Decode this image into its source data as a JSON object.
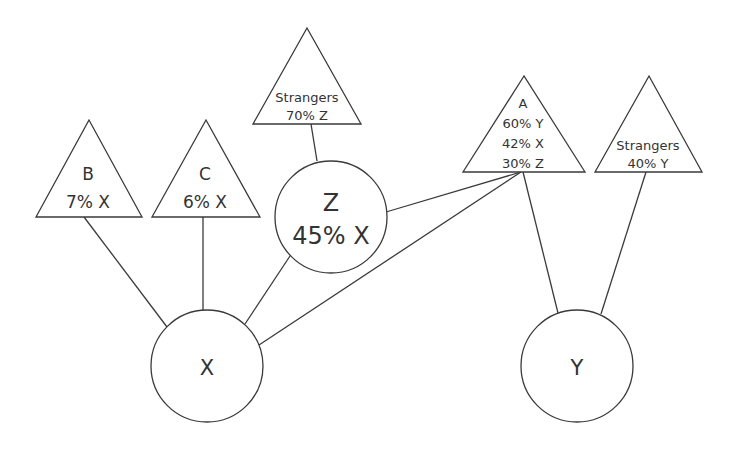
{
  "diagram": {
    "type": "network",
    "nodes": [
      {
        "id": "X",
        "shape": "circle",
        "lines": [
          "X"
        ]
      },
      {
        "id": "Y",
        "shape": "circle",
        "lines": [
          "Y"
        ]
      },
      {
        "id": "Z",
        "shape": "circle",
        "lines": [
          "Z",
          "45% X"
        ]
      },
      {
        "id": "B",
        "shape": "triangle",
        "lines": [
          "B",
          "7% X"
        ]
      },
      {
        "id": "C",
        "shape": "triangle",
        "lines": [
          "C",
          "6% X"
        ]
      },
      {
        "id": "StrangersZ",
        "shape": "triangle",
        "lines": [
          "Strangers",
          "70% Z"
        ]
      },
      {
        "id": "A",
        "shape": "triangle",
        "lines": [
          "A",
          "60% Y",
          "42% X",
          "30% Z"
        ]
      },
      {
        "id": "StrangersY",
        "shape": "triangle",
        "lines": [
          "Strangers",
          "40% Y"
        ]
      }
    ],
    "edges": [
      [
        "B",
        "X"
      ],
      [
        "C",
        "X"
      ],
      [
        "Z",
        "X"
      ],
      [
        "A",
        "X"
      ],
      [
        "StrangersZ",
        "Z"
      ],
      [
        "Z",
        "A"
      ],
      [
        "A",
        "Y"
      ],
      [
        "StrangersY",
        "Y"
      ]
    ]
  },
  "labels": {
    "x": {
      "title": "X"
    },
    "y": {
      "title": "Y"
    },
    "z": {
      "title": "Z",
      "value": "45% X"
    },
    "b": {
      "title": "B",
      "value": "7% X"
    },
    "c": {
      "title": "C",
      "value": "6% X"
    },
    "strangers_z": {
      "title": "Strangers",
      "value": "70% Z"
    },
    "a": {
      "title": "A",
      "l1": "60% Y",
      "l2": "42% X",
      "l3": "30% Z"
    },
    "strangers_y": {
      "title": "Strangers",
      "value": "40% Y"
    }
  },
  "colors": {
    "stroke": "#3a3a3a",
    "text": "#333333",
    "background": "#ffffff"
  }
}
